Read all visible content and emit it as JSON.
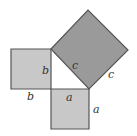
{
  "diagram": {
    "colors": {
      "small_square_fill": "#c8c8c8",
      "large_square_fill": "#9a9a9a",
      "stroke": "#555555",
      "label": "#333333"
    },
    "squares": [
      {
        "name": "square-b",
        "side_label": "b",
        "points": "11,49 51,49 51,89 11,89"
      },
      {
        "name": "square-a",
        "side_label": "a",
        "points": "51,89 89,89 89,129 51,129"
      },
      {
        "name": "square-c",
        "side_label": "c",
        "points": "51,49 88,10 128,50 89,89"
      }
    ],
    "labels": [
      {
        "name": "label-b-inner",
        "text": "b",
        "x": 42,
        "y": 74
      },
      {
        "name": "label-b-outer",
        "text": "b",
        "x": 27,
        "y": 100
      },
      {
        "name": "label-c-inner",
        "text": "c",
        "x": 72,
        "y": 69
      },
      {
        "name": "label-c-outer",
        "text": "c",
        "x": 108,
        "y": 78
      },
      {
        "name": "label-a-inner",
        "text": "a",
        "x": 66,
        "y": 101
      },
      {
        "name": "label-a-outer",
        "text": "a",
        "x": 93,
        "y": 113
      }
    ]
  }
}
